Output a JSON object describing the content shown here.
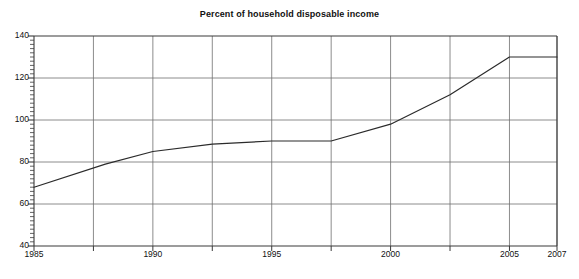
{
  "chart_data": {
    "type": "line",
    "title": "Percent of household disposable income",
    "xlabel": "",
    "ylabel": "",
    "xlim": [
      1985,
      2007
    ],
    "ylim": [
      40,
      140
    ],
    "grid": true,
    "legend": "none",
    "x_ticks": [
      1985,
      1990,
      1995,
      2000,
      2005,
      2007
    ],
    "x_tick_labels": [
      "1985",
      "1990",
      "1995",
      "2000",
      "2005",
      "2007"
    ],
    "x_gridlines": [
      1985,
      1987.5,
      1990,
      1992.5,
      1995,
      1997.5,
      2000,
      2002.5,
      2005,
      2007
    ],
    "y_ticks": [
      40,
      60,
      80,
      100,
      120,
      140
    ],
    "y_tick_labels": [
      "40",
      "60",
      "80",
      "100",
      "120",
      "140"
    ],
    "y_minor_tick_step": 2,
    "series": [
      {
        "name": "Percent of household disposable income",
        "color": "#2b2b2b",
        "x": [
          1985,
          1988,
          1990,
          1992.5,
          1995,
          1997.5,
          2000,
          2002.5,
          2005,
          2007
        ],
        "values": [
          68,
          79,
          85,
          88.5,
          90,
          90,
          98,
          112,
          130,
          130
        ]
      }
    ]
  },
  "style": {
    "axis_color": "#3a3a3a",
    "grid_color": "#6f6f6f",
    "line_color": "#2b2b2b",
    "background": "#ffffff",
    "text_color": "#111111"
  }
}
